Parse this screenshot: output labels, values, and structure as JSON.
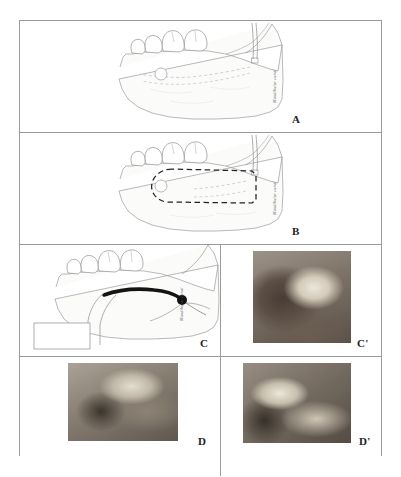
{
  "figure": {
    "type": "surgical-illustration-series",
    "panel_count": 6,
    "border_color": "#9a9a9a",
    "background_color": "#ffffff"
  },
  "panels": [
    {
      "letter": "A",
      "kind": "line-drawing",
      "subject": "mandible lateral view with mental foramen and inferior alveolar nerve canal",
      "canal_label": "Mandibular canal"
    },
    {
      "letter": "B",
      "kind": "line-drawing",
      "subject": "mandible with dashed osteotomy outline around mandibular canal",
      "canal_label": "Mandibular canal"
    },
    {
      "letter": "C",
      "kind": "line-drawing",
      "subject": "mandible with repositioned inferior alveolar nerve and bone window removed",
      "canal_label": "Mandibular canal"
    },
    {
      "letter": "C'",
      "kind": "clinical-photograph",
      "subject": "intraoral view of posterior mandible and teeth"
    },
    {
      "letter": "D",
      "kind": "clinical-photograph",
      "subject": "surgical exposure of mandibular buccal cortical bone"
    },
    {
      "letter": "D'",
      "kind": "clinical-photograph",
      "subject": "exposed inferior alveolar nerve after lateralization"
    }
  ]
}
